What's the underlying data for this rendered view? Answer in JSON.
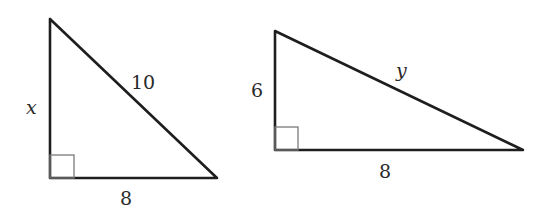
{
  "triangles": [
    {
      "id": "left",
      "right_angle_marker": true,
      "vertices": {
        "top": [
          50,
          19
        ],
        "right_angle": [
          50,
          178
        ],
        "right": [
          217,
          178
        ]
      },
      "labels": {
        "vertical_leg": "x",
        "hypotenuse": "10",
        "horizontal_leg": "8"
      }
    },
    {
      "id": "right",
      "right_angle_marker": true,
      "vertices": {
        "top": [
          275,
          31
        ],
        "right_angle": [
          275,
          150
        ],
        "right": [
          523,
          150
        ]
      },
      "labels": {
        "vertical_leg": "6",
        "hypotenuse": "y",
        "horizontal_leg": "8"
      }
    }
  ],
  "colors": {
    "stroke": "#1e1e1e",
    "right_angle_marker": "#7a7a7a",
    "text": "#2a2a2a",
    "background": "#ffffff"
  }
}
